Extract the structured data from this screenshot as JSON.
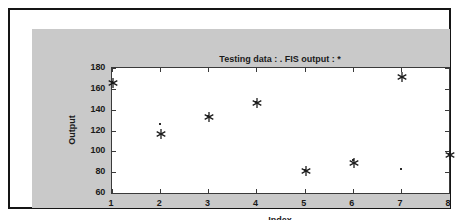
{
  "figure": {
    "title": "Testing data : .   FIS output : *",
    "background_color": "#c9c9c9",
    "axes_background_color": "#ffffff",
    "border_color": "#151515"
  },
  "axes": {
    "xlabel": "Index",
    "ylabel": "Output",
    "xticks": [
      "1",
      "2",
      "3",
      "4",
      "5",
      "6",
      "7",
      "8"
    ],
    "yticks": [
      "180",
      "160",
      "140",
      "120",
      "100",
      "80",
      "60"
    ]
  },
  "chart_data": {
    "type": "scatter",
    "title": "Testing data : .   FIS output : *",
    "xlabel": "Index",
    "ylabel": "Output",
    "xlim": [
      1,
      8
    ],
    "ylim": [
      60,
      180
    ],
    "xticks": [
      1,
      2,
      3,
      4,
      5,
      6,
      7,
      8
    ],
    "yticks": [
      60,
      80,
      100,
      120,
      140,
      160,
      180
    ],
    "grid": false,
    "legend": "in-title",
    "x": [
      1,
      2,
      3,
      4,
      5,
      6,
      7,
      8
    ],
    "series": [
      {
        "name": "Testing data",
        "marker": ".",
        "values": [
          167,
          126,
          134,
          147,
          82,
          92,
          83,
          97
        ]
      },
      {
        "name": "FIS output",
        "marker": "*",
        "values": [
          167,
          118,
          134,
          147,
          82,
          90,
          172,
          97
        ]
      }
    ]
  }
}
